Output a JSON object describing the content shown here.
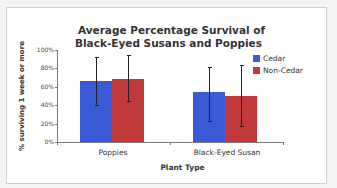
{
  "chart_data": {
    "type": "bar",
    "title": "Average Percentage Survival of Black-Eyed Susans and Poppies",
    "title_lines": [
      "Average Percentage Survival of",
      "Black-Eyed Susans and Poppies"
    ],
    "xlabel": "Plant Type",
    "ylabel": "% surviving 1 week or more",
    "categories": [
      "Poppies",
      "Black-Eyed Susan"
    ],
    "series": [
      {
        "name": "Cedar",
        "color": "#3b5bd6",
        "values": [
          66,
          54
        ],
        "error_low": [
          40,
          23
        ],
        "error_high": [
          92,
          81
        ]
      },
      {
        "name": "Non-Cedar",
        "color": "#c0393b",
        "values": [
          69,
          50
        ],
        "error_low": [
          45,
          17
        ],
        "error_high": [
          95,
          84
        ]
      }
    ],
    "yticks": [
      "0%",
      "20%",
      "40%",
      "60%",
      "80%",
      "100%"
    ],
    "ylim": [
      0,
      100
    ],
    "grid": false,
    "legend_position": "top-right"
  }
}
